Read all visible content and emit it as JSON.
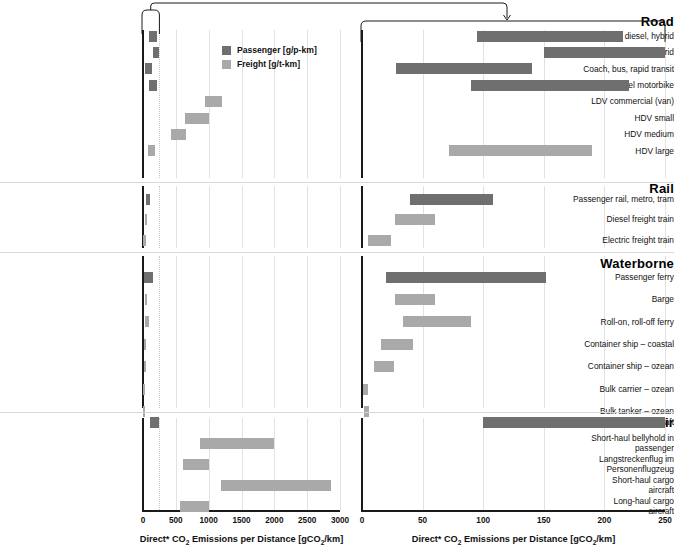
{
  "legend": {
    "position": "top-left-panel",
    "items": [
      {
        "key": "passenger",
        "label": "Passenger [g/p-km]",
        "color": "#6f6f6f"
      },
      {
        "key": "freight",
        "label": "Freight [g/t-km]",
        "color": "#a9a9a9"
      }
    ]
  },
  "axes": {
    "left": {
      "title": "Direct* CO2 Emissions per Distance [gCO2/km]",
      "ticks": [
        0,
        500,
        1000,
        1500,
        2000,
        2500,
        3000
      ],
      "min": 0,
      "max": 3000
    },
    "right": {
      "title": "Direct* CO2 Emissions per Distance [gCO2/km]",
      "ticks": [
        0,
        50,
        100,
        150,
        200,
        250
      ],
      "min": 0,
      "max": 250
    }
  },
  "chart_data": {
    "type": "bar",
    "orientation": "horizontal",
    "variant": "range-bars-dual-panel-zoom",
    "title": "",
    "xlabel": "Direct* CO2 Emissions per Distance [gCO2/km]",
    "ylabel": "",
    "grid": true,
    "legend_position": "inside-top-left",
    "panels": [
      {
        "name": "overview",
        "xlim": [
          0,
          3000
        ],
        "xticks": [
          0,
          500,
          1000,
          1500,
          2000,
          2500,
          3000
        ]
      },
      {
        "name": "detail",
        "xlim": [
          0,
          250
        ],
        "xticks": [
          0,
          50,
          100,
          150,
          200,
          250
        ]
      }
    ],
    "series": [
      {
        "name": "Passenger [g/p-km]",
        "color": "#6f6f6f"
      },
      {
        "name": "Freight [g/t-km]",
        "color": "#a9a9a9"
      }
    ],
    "groups": [
      {
        "section": "Road",
        "rows": [
          {
            "label": "LDV gasoline, diesel, hybrid",
            "series": "passenger",
            "low": 95,
            "high": 215
          },
          {
            "label": "LDV taxi gasoline, diesel, hybrid",
            "series": "passenger",
            "low": 150,
            "high": 250
          },
          {
            "label": "Coach, bus, rapid transit",
            "series": "passenger",
            "low": 28,
            "high": 140
          },
          {
            "label": "2- and 3-wheel motorbike",
            "series": "passenger",
            "low": 90,
            "high": 220
          },
          {
            "label": "LDV commercial (van)",
            "series": "freight",
            "low": 950,
            "high": 1200
          },
          {
            "label": "HDV small",
            "series": "freight",
            "low": 640,
            "high": 1000
          },
          {
            "label": "HDV medium",
            "series": "freight",
            "low": 420,
            "high": 650
          },
          {
            "label": "HDV large",
            "series": "freight",
            "low": 72,
            "high": 190
          }
        ]
      },
      {
        "section": "Rail",
        "rows": [
          {
            "label": "Passenger rail, metro, tram",
            "series": "passenger",
            "low": 40,
            "high": 108
          },
          {
            "label": "Diesel freight train",
            "series": "freight",
            "low": 27,
            "high": 60
          },
          {
            "label": "Electric freight train",
            "series": "freight",
            "low": 5,
            "high": 24
          }
        ]
      },
      {
        "section": "Waterborne",
        "rows": [
          {
            "label": "Passenger ferry",
            "series": "passenger",
            "low": 20,
            "high": 152
          },
          {
            "label": "Barge",
            "series": "freight",
            "low": 27,
            "high": 60
          },
          {
            "label": "Roll-on, roll-off ferry",
            "series": "freight",
            "low": 34,
            "high": 90
          },
          {
            "label": "Container ship – coastal",
            "series": "freight",
            "low": 16,
            "high": 42
          },
          {
            "label": "Container ship – ozean",
            "series": "freight",
            "low": 10,
            "high": 26
          },
          {
            "label": "Bulk carrier – ozean",
            "series": "freight",
            "low": 1,
            "high": 5
          },
          {
            "label": "Bulk tanker – ozean",
            "series": "freight",
            "low": 2,
            "high": 6
          }
        ]
      },
      {
        "section": "Air",
        "rows": [
          {
            "label": "Passenger aircraft",
            "series": "passenger",
            "low": 100,
            "high": 250
          },
          {
            "label": "Short-haul bellyhold in\npassenger",
            "series": "freight",
            "low": 870,
            "high": 2000
          },
          {
            "label": "Langstreckenflug im\nPersonenflugzeug",
            "series": "freight",
            "low": 610,
            "high": 1000
          },
          {
            "label": "Short-haul cargo\naircraft",
            "series": "freight",
            "low": 1190,
            "high": 2870
          },
          {
            "label": "Long-haul cargo\naircraft",
            "series": "freight",
            "low": 570,
            "high": 1000
          }
        ]
      }
    ]
  }
}
